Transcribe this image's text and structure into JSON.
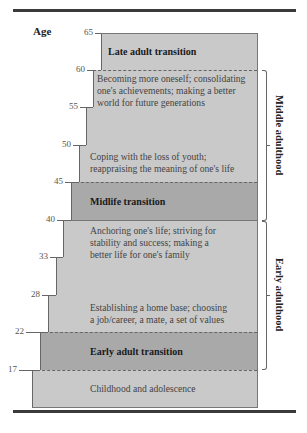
{
  "figure": {
    "axis_label": "Age",
    "ticks": [
      "65",
      "60",
      "55",
      "50",
      "45",
      "40",
      "33",
      "28",
      "22",
      "17"
    ],
    "bands": [
      {
        "title": "Late adult transition",
        "ages": "60-65",
        "type": "transition"
      },
      {
        "text_lines": [
          "Becoming more oneself; consolidating",
          "one's achievements; making a better",
          "world for future generations"
        ],
        "ages": "50-60"
      },
      {
        "text_lines": [
          "Coping with the loss of youth;",
          "reappraising the meaning of one's life"
        ],
        "ages": "45-50"
      },
      {
        "title": "Midlife transition",
        "ages": "40-45",
        "type": "transition"
      },
      {
        "text_lines": [
          "Anchoring one's life; striving for",
          "stability and success; making a",
          "better life for one's family"
        ],
        "ages": "33-40"
      },
      {
        "text_lines": [
          "Establishing a home base; choosing",
          "a job/career, a mate, a set of values"
        ],
        "ages": "22-28"
      },
      {
        "title": "Early adult transition",
        "ages": "17-22",
        "type": "transition"
      },
      {
        "text_lines": [
          "Childhood and adolescence"
        ],
        "ages": "0-17"
      }
    ],
    "brackets": [
      {
        "label": "Middle adulthood",
        "from": "40",
        "to": "60"
      },
      {
        "label": "Early adulthood",
        "from": "17",
        "to": "40"
      }
    ],
    "colors": {
      "light_band": "#c9c9c9",
      "dark_band": "#a9a9a9",
      "rule": "#3a3a3a"
    }
  }
}
